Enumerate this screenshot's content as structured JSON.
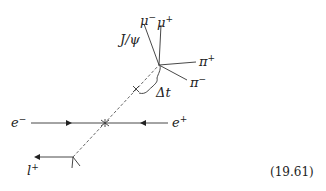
{
  "diagram": {
    "labels": {
      "jpsi": "J/ψ",
      "mu_minus": "μ",
      "mu_minus_sup": "−",
      "mu_plus": "μ",
      "mu_plus_sup": "+",
      "pi_plus": "π",
      "pi_plus_sup": "+",
      "pi_minus": "π",
      "pi_minus_sup": "−",
      "delta_t": "Δt",
      "e_minus": "e",
      "e_minus_sup": "−",
      "e_plus": "e",
      "e_plus_sup": "+",
      "lepton": "l",
      "lepton_sup": "+"
    },
    "equation_number": "(19.61)",
    "colors": {
      "line": "#333333",
      "dash": "#555555"
    }
  }
}
